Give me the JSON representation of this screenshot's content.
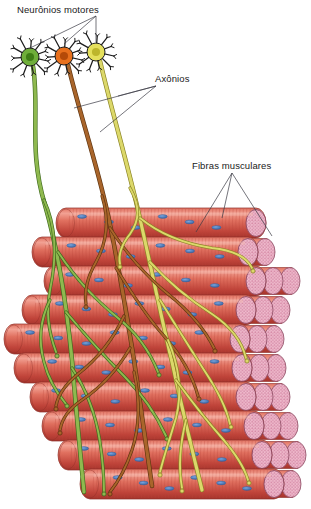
{
  "figure": {
    "title_text": "Neurônios motores",
    "background": "#ffffff",
    "width": 311,
    "height": 509
  },
  "labels": [
    {
      "id": "neuronios-motores",
      "text": "Neurônios motores",
      "x": 17,
      "y": 4,
      "leader_from": [
        96,
        16
      ],
      "leader_to": [
        [
          30,
          48
        ],
        [
          64,
          44
        ],
        [
          96,
          42
        ]
      ]
    },
    {
      "id": "axonios",
      "text": "Axônios",
      "x": 155,
      "y": 73,
      "leader_from": [
        156,
        86
      ],
      "leader_to": [
        [
          74,
          108
        ],
        [
          100,
          132
        ],
        [
          118,
          96
        ]
      ]
    },
    {
      "id": "fibras-musculares",
      "text": "Fibras musculares",
      "x": 192,
      "y": 160,
      "leader_from": [
        232,
        173
      ],
      "leader_to": [
        [
          196,
          232
        ],
        [
          222,
          218
        ],
        [
          272,
          236
        ]
      ]
    }
  ],
  "palette": {
    "leader_line": "#3a3a44",
    "label_text": "#1a1a1a",
    "fiber_light": "#f2a193",
    "fiber_mid": "#e0705f",
    "fiber_dark": "#c0443a",
    "fiber_outline": "#8d2f28",
    "striation": "#b8443a",
    "nucleus_blue": "#4f7fc4",
    "nucleus_blue_dark": "#2f5a99",
    "cap_pink": "#e8a8bd",
    "cap_speckle": "#c46f92",
    "cap_outline": "#8d4a62",
    "neuron_green": "#6fae3a",
    "neuron_green_core": "#3f7d16",
    "neuron_orange": "#e8701c",
    "neuron_orange_core": "#b44a08",
    "neuron_yellow": "#e5e05c",
    "neuron_yellow_core": "#bdb62c",
    "axon_green": "#8fb94f",
    "axon_green_edge": "#3f6b1e",
    "axon_brown": "#a9652b",
    "axon_brown_edge": "#5e3410",
    "axon_yellow": "#dcd86a",
    "axon_yellow_edge": "#8a8324"
  },
  "neurons": [
    {
      "id": "neuron-green",
      "color_key": "neuron_green",
      "core_key": "neuron_green_core",
      "cx": 30,
      "cy": 57,
      "r": 9,
      "spokes": 11
    },
    {
      "id": "neuron-orange",
      "color_key": "neuron_orange",
      "core_key": "neuron_orange_core",
      "cx": 64,
      "cy": 56,
      "r": 9,
      "spokes": 11
    },
    {
      "id": "neuron-yellow",
      "color_key": "neuron_yellow",
      "core_key": "neuron_yellow_core",
      "cx": 96,
      "cy": 52,
      "r": 9,
      "spokes": 11
    }
  ],
  "axons": [
    {
      "id": "axon-green",
      "stroke_key": "axon_green",
      "edge_key": "axon_green_edge",
      "path": "M33,66 C40,110 28,150 45,205 C58,250 66,300 72,360 C76,410 80,450 84,492"
    },
    {
      "id": "axon-brown",
      "stroke_key": "axon_brown",
      "edge_key": "axon_brown_edge",
      "path": "M68,65 C80,115 96,160 108,215 C118,262 126,310 134,360 C140,404 146,444 152,486"
    },
    {
      "id": "axon-yellow",
      "stroke_key": "axon_yellow",
      "edge_key": "axon_yellow_edge",
      "path": "M100,61 C112,112 126,158 138,210 C150,262 160,312 172,362 C182,408 192,450 202,490"
    }
  ],
  "branches": [
    {
      "id": "br-g1",
      "color_key": "axon_green",
      "edge_key": "axon_green_edge",
      "path": "M44,200 C58,230 56,262 50,290 C46,312 48,330 56,352",
      "tip": [
        57,
        356
      ]
    },
    {
      "id": "br-g2",
      "color_key": "axon_green",
      "edge_key": "axon_green_edge",
      "path": "M58,252 C78,282 96,300 118,318 C138,334 150,352 158,372",
      "tip": [
        159,
        375
      ]
    },
    {
      "id": "br-g3",
      "color_key": "axon_green",
      "edge_key": "axon_green_edge",
      "path": "M66,312 C86,336 104,356 124,376 C142,394 156,414 166,436",
      "tip": [
        167,
        439
      ]
    },
    {
      "id": "br-g4",
      "color_key": "axon_green",
      "edge_key": "axon_green_edge",
      "path": "M72,368 C88,392 96,416 100,442 C103,462 104,478 104,492",
      "tip": [
        104,
        494
      ]
    },
    {
      "id": "br-g5",
      "color_key": "axon_green",
      "edge_key": "axon_green_edge",
      "path": "M50,300 C40,320 38,340 44,362 C48,378 56,392 66,404",
      "tip": [
        67,
        406
      ]
    },
    {
      "id": "br-b1",
      "color_key": "axon_brown",
      "edge_key": "axon_brown_edge",
      "path": "M102,196 C110,222 106,244 96,262 C88,276 84,290 86,304",
      "tip": [
        86,
        307
      ]
    },
    {
      "id": "br-b2",
      "color_key": "axon_brown",
      "edge_key": "axon_brown_edge",
      "path": "M110,228 C128,256 146,276 168,294 C188,310 204,328 214,348",
      "tip": [
        215,
        351
      ]
    },
    {
      "id": "br-b3",
      "color_key": "axon_brown",
      "edge_key": "axon_brown_edge",
      "path": "M116,268 C132,294 146,316 164,336 C180,354 192,374 198,396",
      "tip": [
        199,
        399
      ]
    },
    {
      "id": "br-b4",
      "color_key": "axon_brown",
      "edge_key": "axon_brown_edge",
      "path": "M124,316 C112,342 96,360 78,374 C66,384 58,394 56,406",
      "tip": [
        56,
        409
      ]
    },
    {
      "id": "br-b5",
      "color_key": "axon_brown",
      "edge_key": "axon_brown_edge",
      "path": "M134,372 C140,400 140,426 132,450 C126,468 118,482 110,492",
      "tip": [
        110,
        494
      ]
    },
    {
      "id": "br-b6",
      "color_key": "axon_brown",
      "edge_key": "axon_brown_edge",
      "path": "M130,348 C116,372 100,388 82,400 C70,408 62,418 60,430",
      "tip": [
        60,
        433
      ]
    },
    {
      "id": "br-y1",
      "color_key": "axon_yellow",
      "edge_key": "axon_yellow_edge",
      "path": "M130,188 C140,206 140,220 130,234 C122,244 118,254 120,264",
      "tip": [
        120,
        267
      ]
    },
    {
      "id": "br-y2",
      "color_key": "axon_yellow",
      "edge_key": "axon_yellow_edge",
      "path": "M140,218 C162,236 186,244 212,248 C232,250 246,256 252,268",
      "tip": [
        253,
        271
      ]
    },
    {
      "id": "br-y3",
      "color_key": "axon_yellow",
      "edge_key": "axon_yellow_edge",
      "path": "M150,262 C170,284 190,300 212,314 C230,326 242,342 246,358",
      "tip": [
        247,
        361
      ]
    },
    {
      "id": "br-y4",
      "color_key": "axon_yellow",
      "edge_key": "axon_yellow_edge",
      "path": "M160,300 C176,326 190,348 204,370 C216,388 226,406 230,424",
      "tip": [
        231,
        427
      ]
    },
    {
      "id": "br-y5",
      "color_key": "axon_yellow",
      "edge_key": "axon_yellow_edge",
      "path": "M168,340 C180,368 182,394 176,418 C170,438 164,456 160,472",
      "tip": [
        160,
        475
      ]
    },
    {
      "id": "br-y6",
      "color_key": "axon_yellow",
      "edge_key": "axon_yellow_edge",
      "path": "M176,380 C192,402 206,420 222,438 C234,452 244,466 248,480",
      "tip": [
        249,
        483
      ]
    },
    {
      "id": "br-y7",
      "color_key": "axon_yellow",
      "edge_key": "axon_yellow_edge",
      "path": "M186,420 C180,444 178,466 182,488",
      "tip": [
        182,
        491
      ]
    }
  ],
  "fiber_rows": [
    {
      "id": "row-1",
      "x": 60,
      "y": 208,
      "w": 196,
      "h": 30,
      "nuclei": 6,
      "caps": 1
    },
    {
      "id": "row-2",
      "x": 36,
      "y": 237,
      "w": 212,
      "h": 30,
      "nuclei": 6,
      "caps": 2
    },
    {
      "id": "row-3",
      "x": 48,
      "y": 266,
      "w": 208,
      "h": 30,
      "nuclei": 6,
      "caps": 3
    },
    {
      "id": "row-4",
      "x": 26,
      "y": 295,
      "w": 220,
      "h": 30,
      "nuclei": 7,
      "caps": 3
    },
    {
      "id": "row-5",
      "x": 8,
      "y": 324,
      "w": 232,
      "h": 30,
      "nuclei": 7,
      "caps": 3
    },
    {
      "id": "row-6",
      "x": 18,
      "y": 353,
      "w": 224,
      "h": 30,
      "nuclei": 7,
      "caps": 3
    },
    {
      "id": "row-7",
      "x": 34,
      "y": 382,
      "w": 212,
      "h": 30,
      "nuclei": 6,
      "caps": 3
    },
    {
      "id": "row-8",
      "x": 46,
      "y": 411,
      "w": 208,
      "h": 30,
      "nuclei": 6,
      "caps": 3
    },
    {
      "id": "row-9",
      "x": 62,
      "y": 440,
      "w": 200,
      "h": 30,
      "nuclei": 6,
      "caps": 3
    },
    {
      "id": "row-10",
      "x": 84,
      "y": 469,
      "w": 190,
      "h": 30,
      "nuclei": 6,
      "caps": 2
    }
  ]
}
